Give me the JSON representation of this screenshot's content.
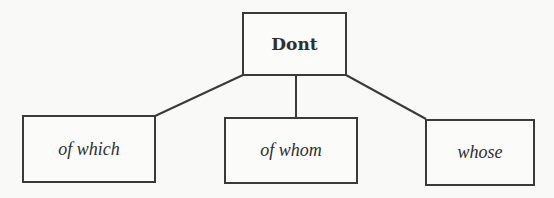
{
  "diagram": {
    "type": "tree",
    "root": {
      "label": "Dont"
    },
    "children": [
      {
        "label": "of which"
      },
      {
        "label": "of whom"
      },
      {
        "label": "whose"
      }
    ],
    "colors": {
      "background": "#f9f9f8",
      "stroke": "#3a3a3a",
      "text": "#2f2f2f"
    }
  }
}
